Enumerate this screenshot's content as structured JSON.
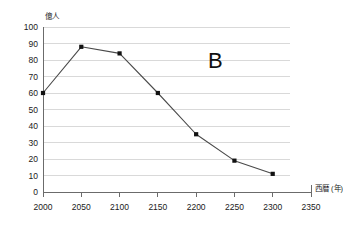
{
  "chart_data": {
    "type": "line",
    "title": "",
    "xlabel": "西暦 (年)",
    "ylabel": "億人",
    "xlim": [
      2000,
      2350
    ],
    "ylim": [
      0,
      100
    ],
    "grid": true,
    "legend": "none",
    "annotations": [
      {
        "text": "B",
        "x": 2225,
        "y": 80
      }
    ],
    "xticks": [
      "2000",
      "2050",
      "2100",
      "2150",
      "2200",
      "2250",
      "2300",
      "2350"
    ],
    "xtick_values": [
      2000,
      2050,
      2100,
      2150,
      2200,
      2250,
      2300,
      2350
    ],
    "yticks": [
      "0",
      "10",
      "20",
      "30",
      "40",
      "50",
      "60",
      "70",
      "80",
      "90",
      "100"
    ],
    "ytick_values": [
      0,
      10,
      20,
      30,
      40,
      50,
      60,
      70,
      80,
      90,
      100
    ],
    "x": [
      2000,
      2050,
      2100,
      2150,
      2200,
      2250,
      2300
    ],
    "values": [
      60,
      88,
      84,
      60,
      35,
      19,
      11
    ],
    "series": [
      {
        "name": "B",
        "x": [
          2000,
          2050,
          2100,
          2150,
          2200,
          2250,
          2300
        ],
        "values": [
          60,
          88,
          84,
          60,
          35,
          19,
          11
        ]
      }
    ],
    "colors": {
      "line": "#4a4a4a",
      "marker": "#111111",
      "grid": "#d9d9d9",
      "axis": "#6b6b6b",
      "text": "#1a1a1a"
    }
  }
}
